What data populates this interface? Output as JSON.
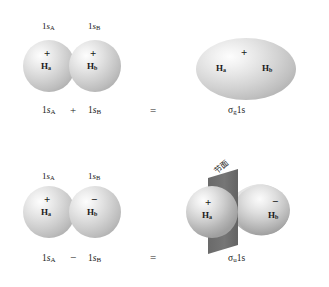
{
  "figure": {
    "background_color": "#ffffff",
    "sphere_color": "#cfcfcf",
    "plane_color": "#6e6e6e"
  },
  "rows": [
    {
      "id": "bonding",
      "orbital_labels": [
        {
          "text": "1s",
          "sub": "A"
        },
        {
          "text": "1s",
          "sub": "B"
        }
      ],
      "atoms": [
        {
          "sign": "+",
          "label": "H",
          "sub": "a"
        },
        {
          "sign": "+",
          "label": "H",
          "sub": "b"
        }
      ],
      "equation": {
        "left": {
          "text": "1s",
          "sub": "A"
        },
        "operator": "+",
        "right": {
          "text": "1s",
          "sub": "B"
        },
        "equals": "=",
        "result": {
          "text": "1s",
          "sub": "g",
          "prefix": "σ"
        }
      },
      "product": {
        "type": "ellipse",
        "sign": "+",
        "atoms": [
          {
            "label": "H",
            "sub": "a"
          },
          {
            "label": "H",
            "sub": "b"
          }
        ]
      }
    },
    {
      "id": "antibonding",
      "orbital_labels": [
        {
          "text": "1s",
          "sub": "A"
        },
        {
          "text": "1s",
          "sub": "B"
        }
      ],
      "atoms": [
        {
          "sign": "+",
          "label": "H",
          "sub": "a"
        },
        {
          "sign": "−",
          "label": "H",
          "sub": "b"
        }
      ],
      "equation": {
        "left": {
          "text": "1s",
          "sub": "A"
        },
        "operator": "−",
        "right": {
          "text": "1s",
          "sub": "B"
        },
        "equals": "=",
        "result": {
          "text": "1s",
          "sub": "u",
          "prefix": "σ"
        }
      },
      "product": {
        "type": "two-lobes-with-node",
        "node_label": "节面",
        "atoms": [
          {
            "sign": "+",
            "label": "H",
            "sub": "a"
          },
          {
            "sign": "−",
            "label": "H",
            "sub": "b"
          }
        ]
      }
    }
  ]
}
